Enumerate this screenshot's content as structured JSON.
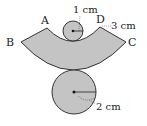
{
  "diagram": {
    "colors": {
      "fill": "#c4c4c4",
      "stroke": "#333333",
      "background": "#ffffff"
    },
    "annular_sector": {
      "outer_path": "M 21 42 Q 73 96 126 42",
      "inner_path": "M 47 28 Q 73 52 100 27",
      "path": "M 21 42 Q 73 96 126 42 L 100 27 Q 73 52 47 28 Z"
    },
    "small_circle": {
      "cx": 73,
      "cy": 31,
      "r": 10,
      "radius_label": "1 cm"
    },
    "large_circle": {
      "cx": 74,
      "cy": 92,
      "r": 22,
      "radius_label": "2 cm"
    },
    "slant_label": "3 cm",
    "points": [
      {
        "name": "A",
        "x": 41,
        "y": 24
      },
      {
        "name": "B",
        "x": 6,
        "y": 46
      },
      {
        "name": "C",
        "x": 128,
        "y": 46
      },
      {
        "name": "D",
        "x": 96,
        "y": 23
      }
    ]
  }
}
